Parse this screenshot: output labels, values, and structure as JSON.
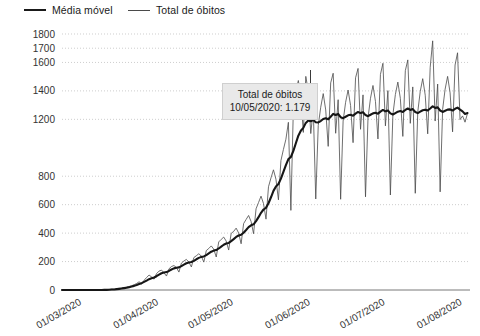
{
  "legend": {
    "items": [
      {
        "label": "Média móvel",
        "style": "thick",
        "color": "#161616"
      },
      {
        "label": "Total de óbitos",
        "style": "thin",
        "color": "#4a4a4a"
      }
    ]
  },
  "annotation": {
    "title": "Total de óbitos",
    "value_line": "10/05/2020: 1.179",
    "date": "10/05/2020",
    "value": 1179,
    "background": "#e9e9e9",
    "border": "#cfcfcf"
  },
  "chart_data": {
    "type": "line",
    "title": "",
    "xlabel": "",
    "ylabel": "",
    "ylim": [
      0,
      1800
    ],
    "grid": true,
    "legend_position": "top-left",
    "y_ticks": [
      0,
      200,
      400,
      600,
      800,
      1200,
      1400,
      1600,
      1700,
      1800
    ],
    "y_tick_labels": [
      "0",
      "200",
      "400",
      "600",
      "800",
      "1200",
      "1400",
      "1600",
      "1700",
      "1800"
    ],
    "x_tick_labels": [
      "01/03/2020",
      "01/04/2020",
      "01/05/2020",
      "01/06/2020",
      "01/07/2020",
      "01/08/2020"
    ],
    "x_tick_positions": [
      0,
      31,
      61,
      92,
      122,
      153
    ],
    "x_range": [
      0,
      164
    ],
    "series": [
      {
        "name": "Total de óbitos",
        "style": "thin",
        "color": "#4a4a4a",
        "values": [
          0,
          0,
          0,
          0,
          0,
          0,
          0,
          0,
          0,
          0,
          0,
          0,
          0,
          0,
          0,
          0,
          1,
          2,
          3,
          4,
          6,
          5,
          9,
          12,
          15,
          18,
          22,
          25,
          30,
          37,
          46,
          58,
          42,
          68,
          88,
          105,
          92,
          76,
          115,
          133,
          140,
          121,
          98,
          149,
          165,
          172,
          158,
          126,
          189,
          204,
          215,
          196,
          162,
          228,
          241,
          255,
          238,
          196,
          277,
          292,
          310,
          287,
          232,
          338,
          356,
          372,
          344,
          281,
          398,
          412,
          435,
          401,
          325,
          467,
          496,
          524,
          482,
          396,
          571,
          615,
          660,
          608,
          498,
          726,
          788,
          845,
          779,
          634,
          910,
          988,
          1060,
          1179,
          560,
          1276,
          1398,
          1473,
          1362,
          1108,
          1502,
          1396,
          1100,
          1272,
          640,
          1157,
          1285,
          1381,
          1266,
          1010,
          1456,
          1524,
          1102,
          1338,
          638,
          1188,
          1320,
          1406,
          1297,
          1036,
          1492,
          1558,
          1130,
          1372,
          655,
          1210,
          1348,
          1438,
          1326,
          1062,
          1516,
          1594,
          1154,
          1402,
          668,
          1232,
          1374,
          1462,
          1348,
          1080,
          1542,
          1618,
          1172,
          1428,
          680,
          1252,
          1396,
          1486,
          1370,
          1098,
          1566,
          1752,
          1188,
          1448,
          690,
          1270,
          1412,
          1502,
          1386,
          1112,
          1582,
          1668,
          1198,
          1224,
          1180,
          1242
        ]
      },
      {
        "name": "Média móvel",
        "style": "thick",
        "color": "#161616",
        "values": [
          0,
          0,
          0,
          0,
          0,
          0,
          0,
          0,
          0,
          0,
          0,
          0,
          0,
          0,
          0,
          0,
          0,
          1,
          1,
          2,
          3,
          4,
          6,
          8,
          10,
          13,
          16,
          20,
          24,
          29,
          35,
          42,
          48,
          57,
          66,
          76,
          83,
          88,
          97,
          108,
          118,
          123,
          126,
          134,
          144,
          152,
          157,
          159,
          168,
          178,
          188,
          194,
          197,
          205,
          216,
          226,
          233,
          236,
          245,
          257,
          269,
          277,
          281,
          292,
          305,
          318,
          327,
          331,
          344,
          358,
          373,
          383,
          388,
          403,
          422,
          442,
          455,
          462,
          484,
          512,
          543,
          566,
          578,
          610,
          652,
          697,
          728,
          745,
          783,
          830,
          878,
          920,
          935,
          978,
          1032,
          1085,
          1120,
          1140,
          1175,
          1192,
          1186,
          1196,
          1180,
          1178,
          1188,
          1202,
          1208,
          1200,
          1218,
          1238,
          1230,
          1238,
          1215,
          1208,
          1218,
          1228,
          1232,
          1226,
          1240,
          1252,
          1244,
          1250,
          1230,
          1222,
          1232,
          1242,
          1246,
          1240,
          1254,
          1266,
          1256,
          1262,
          1242,
          1234,
          1244,
          1254,
          1258,
          1252,
          1266,
          1276,
          1266,
          1272,
          1252,
          1244,
          1254,
          1264,
          1268,
          1262,
          1276,
          1292,
          1280,
          1284,
          1262,
          1252,
          1260,
          1268,
          1270,
          1262,
          1274,
          1282,
          1268,
          1256,
          1238,
          1244
        ]
      }
    ]
  }
}
